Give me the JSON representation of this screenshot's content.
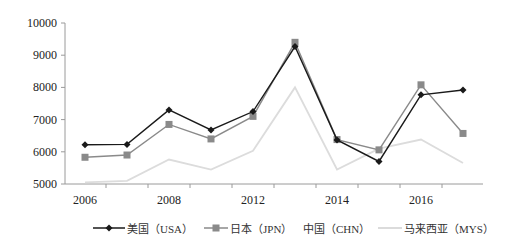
{
  "chart_data": {
    "type": "line",
    "title": "",
    "xlabel": "",
    "ylabel": "",
    "ylim": [
      5000,
      10000
    ],
    "yticks": [
      5000,
      6000,
      7000,
      8000,
      9000,
      10000
    ],
    "grid": false,
    "legend_position": "bottom",
    "x_tick_labels": [
      "2006",
      "2008",
      "2012",
      "2014",
      "2016"
    ],
    "x_tick_label_positions": [
      0,
      2,
      4,
      6,
      8
    ],
    "point_count": 10,
    "series": [
      {
        "name": "美国（USA）",
        "color": "#1a1a1a",
        "marker": "diamond",
        "values": [
          6220,
          6230,
          7300,
          6680,
          7250,
          9270,
          6370,
          5700,
          7770,
          7920
        ]
      },
      {
        "name": "日本（JPN）",
        "color": "#8a8a8a",
        "marker": "square",
        "values": [
          5830,
          5900,
          6850,
          6400,
          7100,
          9400,
          6380,
          6060,
          8080,
          6570
        ]
      },
      {
        "name": "中国（CHN）",
        "color": "#ffffff",
        "marker": "none",
        "values": []
      },
      {
        "name": "马来西亚（MYS）",
        "color": "#dcdcdc",
        "marker": "none",
        "values": [
          5050,
          5100,
          5760,
          5450,
          6030,
          8000,
          5450,
          6100,
          6380,
          5650
        ]
      }
    ]
  },
  "legend": {
    "usa": "美国（USA）",
    "jpn": "日本（JPN）",
    "chn": "中国（CHN）",
    "mys": "马来西亚（MYS）"
  }
}
